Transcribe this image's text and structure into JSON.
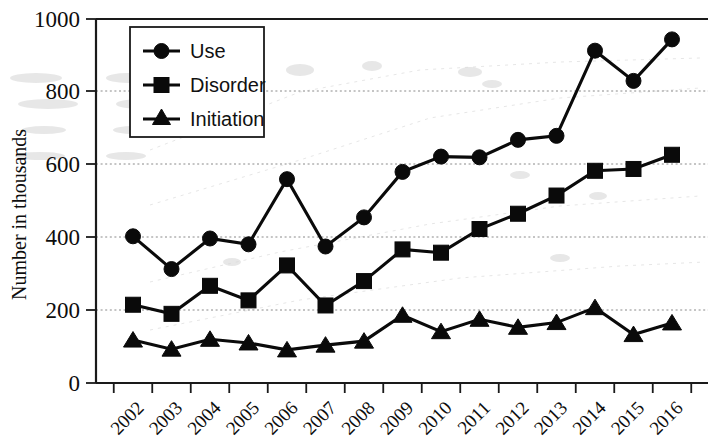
{
  "chart_data": {
    "type": "line",
    "title": "",
    "subtitle": "",
    "xlabel": "",
    "ylabel": "Number in thousands",
    "categories": [
      "2002",
      "2003",
      "2004",
      "2005",
      "2006",
      "2007",
      "2008",
      "2009",
      "2010",
      "2011",
      "2012",
      "2013",
      "2014",
      "2015",
      "2016"
    ],
    "x": [
      2002,
      2003,
      2004,
      2005,
      2006,
      2007,
      2008,
      2009,
      2010,
      2011,
      2012,
      2013,
      2014,
      2015,
      2016
    ],
    "series": [
      {
        "name": "Use",
        "marker": "circle",
        "color": "#0a0a0a",
        "values": [
          403,
          313,
          397,
          381,
          560,
          375,
          455,
          580,
          622,
          620,
          668,
          679,
          913,
          830,
          944
        ]
      },
      {
        "name": "Disorder",
        "marker": "square",
        "color": "#0a0a0a",
        "values": [
          215,
          190,
          267,
          227,
          323,
          213,
          280,
          367,
          358,
          423,
          465,
          515,
          583,
          588,
          627
        ]
      },
      {
        "name": "Initiation",
        "marker": "triangle",
        "color": "#0a0a0a",
        "values": [
          118,
          93,
          120,
          110,
          91,
          104,
          115,
          186,
          141,
          175,
          153,
          166,
          207,
          133,
          165
        ]
      }
    ],
    "ylim": [
      0,
      1000
    ],
    "yticks": [
      0,
      200,
      400,
      600,
      800,
      1000
    ],
    "ytick_labels": [
      "0",
      "200",
      "400",
      "600",
      "800",
      "1000"
    ],
    "grid": true,
    "grid_axis": "y",
    "legend_position": "upper-left-inside",
    "xtick_rotation": -45,
    "annotations": []
  },
  "legend": {
    "entries": [
      {
        "label": "Use",
        "marker": "circle-marker"
      },
      {
        "label": "Disorder",
        "marker": "square-marker"
      },
      {
        "label": "Initiation",
        "marker": "triangle-marker"
      }
    ]
  },
  "axes": {
    "y_title": "Number in thousands"
  }
}
